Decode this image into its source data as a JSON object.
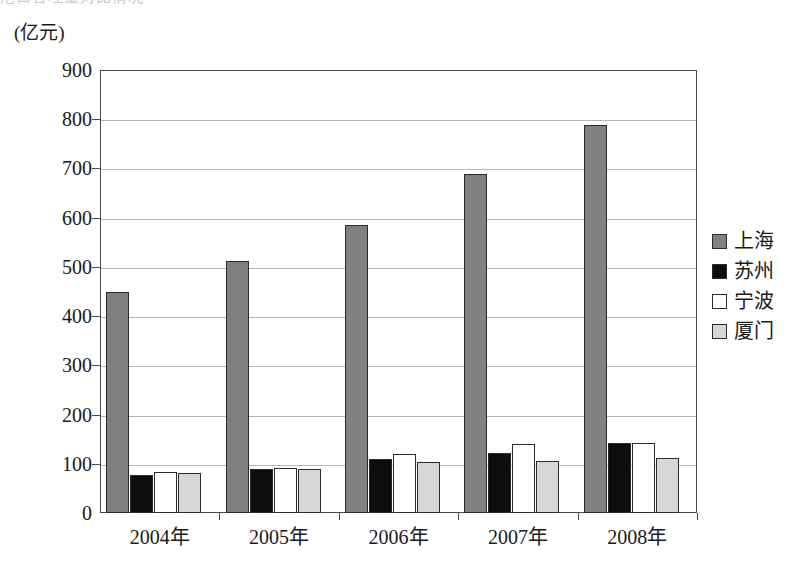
{
  "page": {
    "clipped_top_text": "港口吞吐量对比情况"
  },
  "chart_data": {
    "type": "bar",
    "title": "",
    "subtitle": "",
    "unit_label": "(亿元)",
    "xlabel": "",
    "ylabel": "",
    "ylim": [
      0,
      900
    ],
    "ytick_step": 100,
    "yticks": [
      "900",
      "800",
      "700",
      "600",
      "500",
      "400",
      "300",
      "200",
      "100",
      "0"
    ],
    "ytick_values": [
      900,
      800,
      700,
      600,
      500,
      400,
      300,
      200,
      100,
      0
    ],
    "grid": true,
    "grid_axis": "y",
    "legend_position": "right",
    "categories": [
      "2004年",
      "2005年",
      "2006年",
      "2007年",
      "2008年"
    ],
    "series": [
      {
        "name": "上海",
        "color": "#808080",
        "values": [
          450,
          512,
          585,
          688,
          789
        ]
      },
      {
        "name": "苏州",
        "color": "#0d0d0d",
        "values": [
          77,
          90,
          110,
          122,
          143
        ]
      },
      {
        "name": "宁波",
        "color": "#ffffff",
        "values": [
          83,
          91,
          119,
          141,
          143
        ]
      },
      {
        "name": "厦门",
        "color": "#d7d7d7",
        "values": [
          81,
          89,
          103,
          106,
          111
        ]
      }
    ]
  }
}
